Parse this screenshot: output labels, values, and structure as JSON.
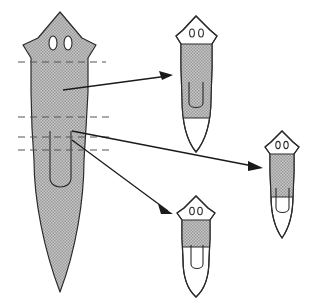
{
  "figure": {
    "background_color": "#ffffff",
    "outline_color": "#2b2b2b",
    "shaded_fill_color": "#b8b8b8",
    "unshaded_fill_color": "#ffffff",
    "cutline_color": "#555555",
    "arrow_color": "#1a1a1a"
  },
  "organisms": [
    {
      "id": "donor-worm",
      "role": "donor",
      "label": "large shaded planarian with cut levels",
      "position": "left",
      "shaded": true,
      "eyespot_count": 2,
      "pharynx_present": true,
      "cut_line_count": 4
    },
    {
      "id": "regenerate-top-right",
      "role": "regenerate",
      "label": "regenerate with unshaded head and tail, shaded trunk band",
      "position": "top-right",
      "shaded": "band",
      "eyespot_count": 2,
      "pharynx_present": true,
      "band_region": "upper-trunk"
    },
    {
      "id": "regenerate-right",
      "role": "regenerate",
      "label": "regenerate with unshaded head and tail, shaded band above pharynx",
      "position": "right",
      "shaded": "band",
      "eyespot_count": 2,
      "pharynx_present": true,
      "band_region": "mid-trunk"
    },
    {
      "id": "regenerate-bottom-middle",
      "role": "regenerate",
      "label": "regenerate with unshaded head and tail, narrow shaded band below head",
      "position": "bottom-middle",
      "shaded": "band",
      "eyespot_count": 2,
      "pharynx_present": true,
      "band_region": "post-pharyngeal"
    }
  ],
  "cut_lines": [
    {
      "id": "cut-1",
      "level": "post-cephalic",
      "y": 62
    },
    {
      "id": "cut-2",
      "level": "pre-pharyngeal",
      "y": 117
    },
    {
      "id": "cut-3",
      "level": "pharyngeal-upper",
      "y": 137
    },
    {
      "id": "cut-4",
      "level": "pharyngeal-lower",
      "y": 150
    }
  ],
  "arrows": [
    {
      "id": "arrow-to-top-right",
      "from": "donor-upper-trunk",
      "to": "regenerate-top-right"
    },
    {
      "id": "arrow-to-right",
      "from": "donor-pharyngeal-region",
      "to": "regenerate-right"
    },
    {
      "id": "arrow-to-bottom-middle",
      "from": "donor-pharyngeal-region",
      "to": "regenerate-bottom-middle"
    }
  ]
}
